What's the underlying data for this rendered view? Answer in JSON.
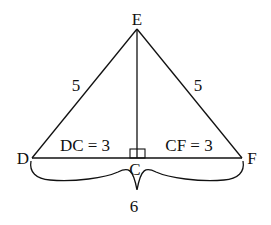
{
  "diagram": {
    "type": "isosceles triangle with altitude",
    "points": {
      "E": {
        "label": "E",
        "x": 137,
        "y": 29
      },
      "D": {
        "label": "D",
        "x": 32,
        "y": 158
      },
      "F": {
        "label": "F",
        "x": 242,
        "y": 158
      },
      "C": {
        "label": "C",
        "x": 137,
        "y": 158
      }
    },
    "labels": {
      "ED_length": "5",
      "EF_length": "5",
      "DC": "DC = 3",
      "CF": "CF = 3",
      "DF_total": "6"
    },
    "right_angle_at": "C",
    "stroke_color": "#111111",
    "background": "#ffffff"
  }
}
